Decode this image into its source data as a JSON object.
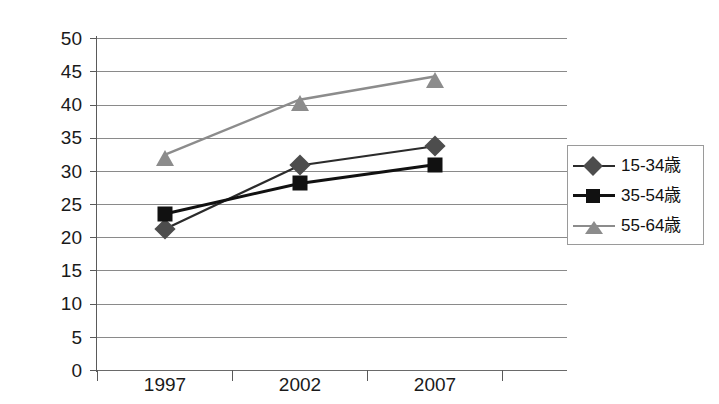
{
  "chart_data": {
    "type": "line",
    "title": "",
    "xlabel": "",
    "ylabel": "",
    "categories": [
      "1997",
      "2002",
      "2007"
    ],
    "ylim": [
      0,
      50
    ],
    "ytick_step": 5,
    "yticks": [
      "50",
      "45",
      "40",
      "35",
      "30",
      "25",
      "20",
      "15",
      "10",
      "5",
      "0"
    ],
    "grid": true,
    "legend_position": "right",
    "series": [
      {
        "name": "15-34歳",
        "marker": "diamond",
        "color": "#4d4d4d",
        "line_color": "#2b2b2b",
        "values": [
          21.2,
          30.8,
          33.7
        ]
      },
      {
        "name": "35-54歳",
        "marker": "square",
        "color": "#111111",
        "line_color": "#111111",
        "values": [
          23.5,
          28.1,
          30.9
        ]
      },
      {
        "name": "55-64歳",
        "marker": "triangle",
        "color": "#8c8c8c",
        "line_color": "#8c8c8c",
        "values": [
          32.4,
          40.7,
          44.2
        ]
      }
    ]
  },
  "axis": {
    "y_labels": [
      "50",
      "45",
      "40",
      "35",
      "30",
      "25",
      "20",
      "15",
      "10",
      "5",
      "0"
    ],
    "x_labels": [
      "1997",
      "2002",
      "2007"
    ]
  },
  "legend": {
    "items": [
      {
        "label": "15-34歳"
      },
      {
        "label": "35-54歳"
      },
      {
        "label": "55-64歳"
      }
    ]
  },
  "caption": {
    "text": ""
  }
}
